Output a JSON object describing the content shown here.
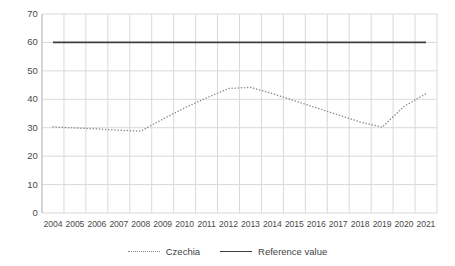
{
  "chart_data": {
    "type": "line",
    "title": "",
    "subtitle": "",
    "xlabel": "",
    "ylabel": "",
    "categories": [
      "2004",
      "2005",
      "2006",
      "2007",
      "2008",
      "2009",
      "2010",
      "2011",
      "2012",
      "2013",
      "2014",
      "2015",
      "2016",
      "2017",
      "2018",
      "2019",
      "2020",
      "2021"
    ],
    "series": [
      {
        "name": "Czechia",
        "style": "dotted",
        "color": "#8a8a8a",
        "values": [
          30.3,
          29.9,
          29.6,
          29.1,
          28.8,
          33.0,
          37.0,
          40.5,
          43.8,
          44.2,
          42.0,
          39.5,
          37.0,
          34.5,
          32.0,
          30.2,
          37.5,
          42.0
        ]
      },
      {
        "name": "Reference value",
        "style": "solid",
        "color": "#3f3f3f",
        "values": [
          60,
          60,
          60,
          60,
          60,
          60,
          60,
          60,
          60,
          60,
          60,
          60,
          60,
          60,
          60,
          60,
          60,
          60
        ]
      }
    ],
    "ylim": [
      0,
      70
    ],
    "ytick_values": [
      70,
      60,
      50,
      40,
      30,
      20,
      10,
      0
    ],
    "ytick_labels": [
      "70",
      "60",
      "50",
      "40",
      "30",
      "20",
      "10",
      "0"
    ],
    "grid": true,
    "grid_color": "#d9d9d9",
    "legend_position": "bottom"
  },
  "legend": {
    "entries": [
      {
        "label": "Czechia",
        "swatch": "dotted-line-swatch"
      },
      {
        "label": "Reference value",
        "swatch": "solid-line-swatch"
      }
    ]
  }
}
